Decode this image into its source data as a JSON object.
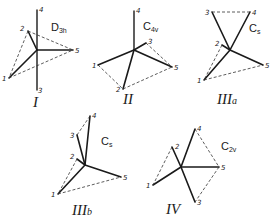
{
  "structures": [
    {
      "id": "I",
      "roman_label": "I",
      "symmetry": {
        "main": "D",
        "sub": "3h"
      },
      "atoms": {
        "1": "1",
        "2": "2",
        "3": "3",
        "4": "4",
        "5": "5"
      }
    },
    {
      "id": "II",
      "roman_label": "II",
      "symmetry": {
        "main": "C",
        "sub": "4v"
      },
      "atoms": {
        "1": "1",
        "2": "2",
        "3": "3",
        "4": "4",
        "5": "5"
      }
    },
    {
      "id": "IIIa",
      "roman_label": "III",
      "roman_suffix": "a",
      "symmetry": {
        "main": "C",
        "sub": "s"
      },
      "atoms": {
        "1": "1",
        "2": "2",
        "3": "3",
        "4": "4",
        "5": "5"
      }
    },
    {
      "id": "IIIb",
      "roman_label": "III",
      "roman_suffix": "b",
      "symmetry": {
        "main": "C",
        "sub": "s"
      },
      "atoms": {
        "1": "1",
        "2": "2",
        "3": "3",
        "4": "4",
        "5": "5"
      }
    },
    {
      "id": "IV",
      "roman_label": "IV",
      "symmetry": {
        "main": "C",
        "sub": "2v"
      },
      "atoms": {
        "1": "1",
        "2": "2",
        "3": "3",
        "4": "4",
        "5": "5"
      }
    }
  ],
  "colors": {
    "line": "#1a1a1a",
    "background": "#ffffff"
  }
}
